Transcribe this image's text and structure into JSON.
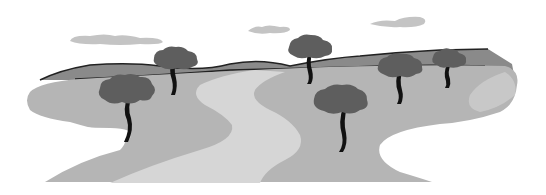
{
  "image": {
    "description": "Grayscale illustration of a landscape with rolling hills, a winding light path, five dark trees and three clouds",
    "colors": {
      "background": "#ffffff",
      "cloud": "#c4c4c4",
      "hill": "#8a8a8a",
      "hill_outline": "#222222",
      "ground": "#b5b5b5",
      "path": "#d6d6d6",
      "tree_canopy": "#5e5e5e",
      "tree_trunk": "#111111"
    },
    "trees": [
      "tree-left-front",
      "tree-back-left",
      "tree-center-back",
      "tree-center-front",
      "tree-right-1",
      "tree-right-2"
    ],
    "clouds": [
      "cloud-left",
      "cloud-center",
      "cloud-right"
    ]
  }
}
